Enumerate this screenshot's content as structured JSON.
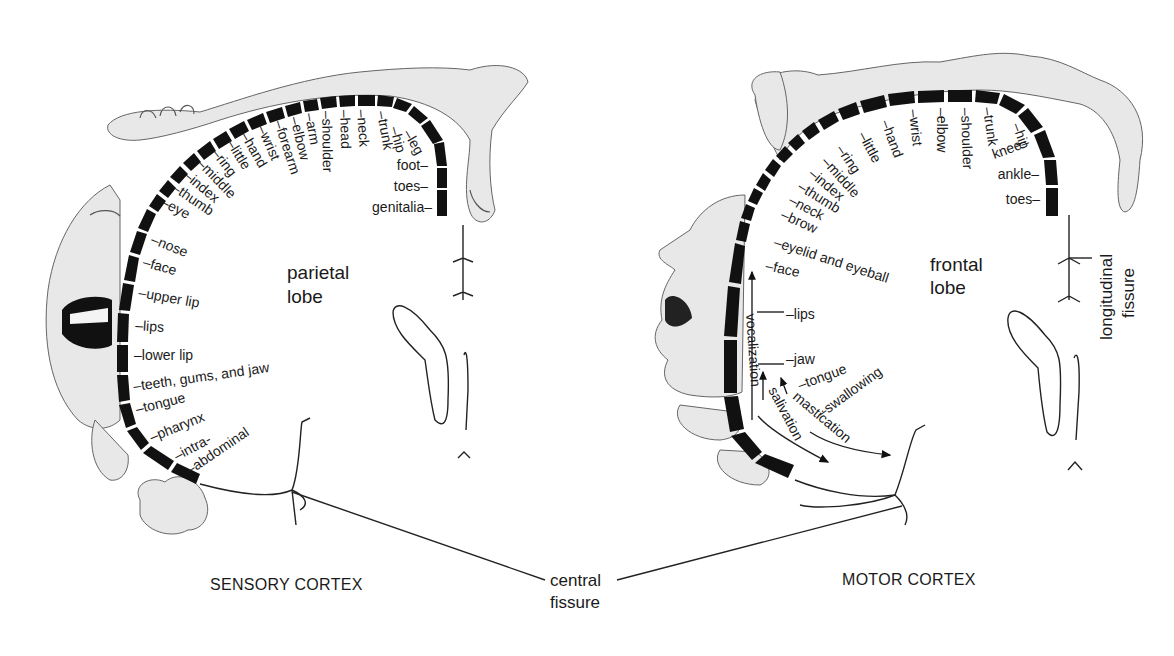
{
  "diagram": {
    "sensory": {
      "title": "SENSORY CORTEX",
      "lobe_line1": "parietal",
      "lobe_line2": "lobe",
      "labels": [
        {
          "text": "genitalia",
          "x": 432,
          "y": 212,
          "rot": 0,
          "anchor": "end"
        },
        {
          "text": "toes",
          "x": 428,
          "y": 191,
          "rot": 0,
          "anchor": "end"
        },
        {
          "text": "foot",
          "x": 428,
          "y": 170,
          "rot": 0,
          "anchor": "end"
        },
        {
          "text": "leg",
          "x": 403,
          "y": 133,
          "rot": 60,
          "anchor": "start"
        },
        {
          "text": "hip",
          "x": 390,
          "y": 128,
          "rot": 75,
          "anchor": "start"
        },
        {
          "text": "trunk",
          "x": 377,
          "y": 112,
          "rot": 80,
          "anchor": "start"
        },
        {
          "text": "neck",
          "x": 357,
          "y": 110,
          "rot": 86,
          "anchor": "start"
        },
        {
          "text": "head",
          "x": 340,
          "y": 110,
          "rot": 88,
          "anchor": "start"
        },
        {
          "text": "shoulder",
          "x": 322,
          "y": 111,
          "rot": 89,
          "anchor": "start"
        },
        {
          "text": "arm",
          "x": 305,
          "y": 114,
          "rot": 80,
          "anchor": "start"
        },
        {
          "text": "elbow",
          "x": 290,
          "y": 118,
          "rot": 76,
          "anchor": "start"
        },
        {
          "text": "forearm",
          "x": 274,
          "y": 122,
          "rot": 72,
          "anchor": "start"
        },
        {
          "text": "wrist",
          "x": 257,
          "y": 128,
          "rot": 66,
          "anchor": "start"
        },
        {
          "text": "hand",
          "x": 240,
          "y": 135,
          "rot": 60,
          "anchor": "start"
        },
        {
          "text": "little",
          "x": 226,
          "y": 143,
          "rot": 58,
          "anchor": "start"
        },
        {
          "text": "ring",
          "x": 211,
          "y": 153,
          "rot": 52,
          "anchor": "start"
        },
        {
          "text": "middle",
          "x": 196,
          "y": 164,
          "rot": 46,
          "anchor": "start"
        },
        {
          "text": "index",
          "x": 183,
          "y": 177,
          "rot": 40,
          "anchor": "start"
        },
        {
          "text": "thumb",
          "x": 171,
          "y": 190,
          "rot": 34,
          "anchor": "start"
        },
        {
          "text": "eye",
          "x": 160,
          "y": 205,
          "rot": 28,
          "anchor": "start"
        },
        {
          "text": "nose",
          "x": 150,
          "y": 243,
          "rot": 22,
          "anchor": "start"
        },
        {
          "text": "face",
          "x": 142,
          "y": 266,
          "rot": 16,
          "anchor": "start"
        },
        {
          "text": "upper lip",
          "x": 138,
          "y": 297,
          "rot": 10,
          "anchor": "start"
        },
        {
          "text": "lips",
          "x": 135,
          "y": 330,
          "rot": 4,
          "anchor": "start"
        },
        {
          "text": "lower lip",
          "x": 134,
          "y": 360,
          "rot": 0,
          "anchor": "start"
        },
        {
          "text": "teeth, gums, and jaw",
          "x": 134,
          "y": 391,
          "rot": -8,
          "anchor": "start"
        },
        {
          "text": "tongue",
          "x": 137,
          "y": 414,
          "rot": -14,
          "anchor": "start"
        },
        {
          "text": "pharynx",
          "x": 152,
          "y": 442,
          "rot": -22,
          "anchor": "start"
        },
        {
          "text": "intra-",
          "x": 177,
          "y": 461,
          "rot": -28,
          "anchor": "start"
        },
        {
          "text": "abdominal",
          "x": 190,
          "y": 475,
          "rot": -34,
          "anchor": "start"
        }
      ]
    },
    "motor": {
      "title": "MOTOR CORTEX",
      "lobe_line1": "frontal",
      "lobe_line2": "lobe",
      "labels": [
        {
          "text": "toes",
          "x": 1040,
          "y": 204,
          "rot": 0,
          "anchor": "end"
        },
        {
          "text": "ankle",
          "x": 1039,
          "y": 179,
          "rot": 0,
          "anchor": "end"
        },
        {
          "text": "knee",
          "x": 1030,
          "y": 146,
          "rot": -20,
          "anchor": "end"
        },
        {
          "text": "hip",
          "x": 1012,
          "y": 125,
          "rot": 70,
          "anchor": "start"
        },
        {
          "text": "trunk",
          "x": 983,
          "y": 108,
          "rot": 82,
          "anchor": "start"
        },
        {
          "text": "shoulder",
          "x": 961,
          "y": 108,
          "rot": 88,
          "anchor": "start"
        },
        {
          "text": "elbow",
          "x": 937,
          "y": 108,
          "rot": 90,
          "anchor": "start"
        },
        {
          "text": "wrist",
          "x": 909,
          "y": 110,
          "rot": 84,
          "anchor": "start"
        },
        {
          "text": "hand",
          "x": 881,
          "y": 122,
          "rot": 70,
          "anchor": "start"
        },
        {
          "text": "little",
          "x": 858,
          "y": 135,
          "rot": 62,
          "anchor": "start"
        },
        {
          "text": "ring",
          "x": 836,
          "y": 149,
          "rot": 56,
          "anchor": "start"
        },
        {
          "text": "middle",
          "x": 821,
          "y": 162,
          "rot": 48,
          "anchor": "start"
        },
        {
          "text": "index",
          "x": 808,
          "y": 175,
          "rot": 40,
          "anchor": "start"
        },
        {
          "text": "thumb",
          "x": 797,
          "y": 189,
          "rot": 32,
          "anchor": "start"
        },
        {
          "text": "neck",
          "x": 788,
          "y": 203,
          "rot": 28,
          "anchor": "start"
        },
        {
          "text": "brow",
          "x": 780,
          "y": 218,
          "rot": 24,
          "anchor": "start"
        },
        {
          "text": "eyelid and eyeball",
          "x": 773,
          "y": 246,
          "rot": 18,
          "anchor": "start"
        },
        {
          "text": "face",
          "x": 765,
          "y": 270,
          "rot": 12,
          "anchor": "start"
        },
        {
          "text": "lips",
          "x": 786,
          "y": 319,
          "rot": 0,
          "anchor": "start"
        },
        {
          "text": "jaw",
          "x": 786,
          "y": 364,
          "rot": 0,
          "anchor": "start"
        },
        {
          "text": "tongue",
          "x": 800,
          "y": 390,
          "rot": -20,
          "anchor": "start"
        },
        {
          "text": "swallowing",
          "x": 822,
          "y": 418,
          "rot": -36,
          "anchor": "start"
        }
      ],
      "arrow_labels": {
        "vocalization": "vocalization",
        "salivation": "salivation",
        "mastication": "mastication"
      }
    },
    "shared": {
      "central_fissure_line1": "central",
      "central_fissure_line2": "fissure",
      "longitudinal_line1": "longitudinal",
      "longitudinal_line2": "fissure"
    }
  }
}
